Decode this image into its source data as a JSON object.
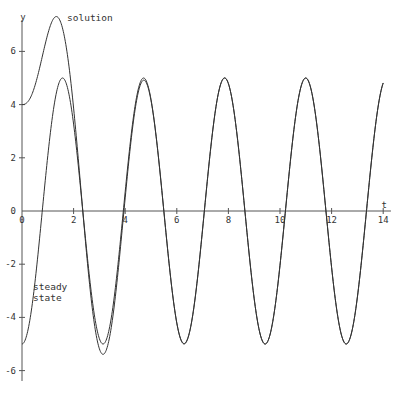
{
  "chart_data": {
    "type": "line",
    "title": "",
    "xlabel": "t",
    "ylabel": "y",
    "xlim": [
      0,
      14
    ],
    "ylim": [
      -7,
      7.3
    ],
    "grid": false,
    "x_ticks": [
      0,
      2,
      4,
      6,
      8,
      10,
      12,
      14
    ],
    "y_ticks": [
      -6,
      -4,
      -2,
      0,
      2,
      4,
      6
    ],
    "series": [
      {
        "name": "solution",
        "description": "starts at y=4 with zero slope, peaks near 7 at t≈1.3, converges to steady state by t≈3",
        "x": [
          0,
          0.5,
          1.0,
          1.3,
          1.5,
          2.0,
          2.5,
          3.0,
          3.14,
          4.0,
          4.71,
          6.28,
          7.85,
          9.42,
          11.0,
          12.57,
          14.0
        ],
        "values": [
          4.0,
          4.7,
          6.4,
          7.0,
          6.8,
          3.9,
          -0.5,
          -4.7,
          -5.1,
          0.7,
          5.0,
          -5.0,
          5.0,
          -5.0,
          5.0,
          -5.0,
          4.7
        ]
      },
      {
        "name": "steady state",
        "description": "y = -5cos(2t)",
        "x": [
          0,
          0.785,
          1.571,
          2.356,
          3.142,
          4.712,
          6.283,
          7.854,
          9.425,
          10.996,
          12.566,
          14.0
        ],
        "values": [
          -5,
          0,
          5,
          0,
          -5,
          5,
          -5,
          5,
          -5,
          5,
          -5,
          4.7
        ]
      }
    ],
    "annotations": [
      {
        "text": "solution",
        "x": 1.75,
        "y": 6.1
      },
      {
        "text": "steady",
        "x": 0.45,
        "y": -3.0
      },
      {
        "text": "state",
        "x": 0.45,
        "y": -3.5
      }
    ]
  },
  "axes": {
    "x_label": "t",
    "y_label": "y",
    "x_tick_labels": [
      "0",
      "2",
      "4",
      "6",
      "8",
      "10",
      "12",
      "14"
    ],
    "y_tick_labels": [
      "-6",
      "-4",
      "-2",
      "0",
      "2",
      "4",
      "6"
    ],
    "origin_label": "0"
  },
  "labels": {
    "solution": "solution",
    "steady_line1": "steady",
    "steady_line2": "state"
  },
  "colors": {
    "curve": "#333333",
    "axis": "#555555"
  }
}
